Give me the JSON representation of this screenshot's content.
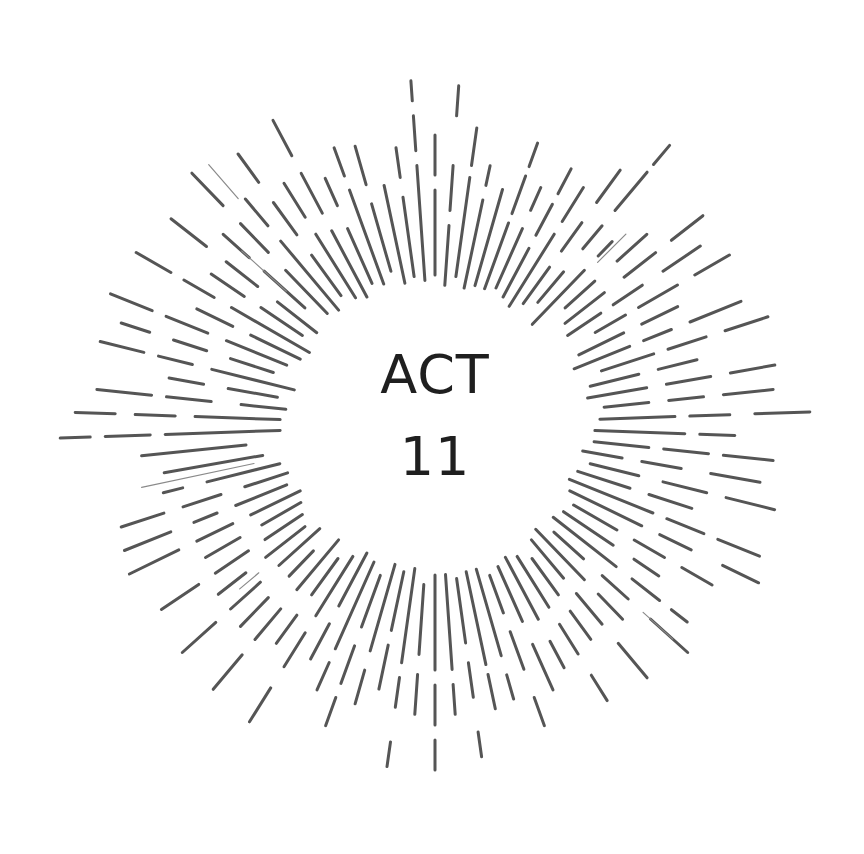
{
  "title": {
    "line1": "ACT",
    "line2": "11"
  },
  "colors": {
    "background": "#ffffff",
    "text": "#1f1f1f",
    "ray": "#555555",
    "ray_light": "#8a8a8a"
  },
  "burst": {
    "center": [
      435,
      425
    ],
    "rays": [
      {
        "a": -90,
        "segs": [
          [
            150,
            235
          ],
          [
            250,
            290
          ]
        ]
      },
      {
        "a": -86,
        "segs": [
          [
            140,
            200
          ],
          [
            215,
            260
          ],
          [
            310,
            340
          ]
        ]
      },
      {
        "a": -82,
        "segs": [
          [
            150,
            250
          ],
          [
            262,
            300
          ]
        ]
      },
      {
        "a": -78,
        "segs": [
          [
            140,
            230
          ],
          [
            245,
            265
          ]
        ]
      },
      {
        "a": -74,
        "segs": [
          [
            145,
            245
          ]
        ]
      },
      {
        "a": -70,
        "segs": [
          [
            145,
            215
          ],
          [
            225,
            265
          ],
          [
            275,
            300
          ]
        ]
      },
      {
        "a": -66,
        "segs": [
          [
            150,
            215
          ],
          [
            235,
            260
          ]
        ]
      },
      {
        "a": -62,
        "segs": [
          [
            145,
            200
          ],
          [
            215,
            250
          ],
          [
            262,
            290
          ]
        ]
      },
      {
        "a": -58,
        "segs": [
          [
            140,
            225
          ],
          [
            240,
            280
          ]
        ]
      },
      {
        "a": -54,
        "segs": [
          [
            150,
            195
          ],
          [
            215,
            250
          ],
          [
            275,
            315
          ]
        ]
      },
      {
        "a": -50,
        "segs": [
          [
            160,
            200
          ],
          [
            230,
            260
          ],
          [
            280,
            330
          ],
          [
            340,
            365
          ]
        ]
      },
      {
        "a": -46,
        "segs": [
          [
            140,
            215
          ],
          [
            235,
            255
          ]
        ]
      },
      {
        "a": -42,
        "segs": [
          [
            175,
            215
          ],
          [
            245,
            285
          ]
        ]
      },
      {
        "a": -38,
        "segs": [
          [
            165,
            215
          ],
          [
            240,
            280
          ],
          [
            300,
            340
          ]
        ]
      },
      {
        "a": -34,
        "segs": [
          [
            160,
            200
          ],
          [
            215,
            250
          ],
          [
            275,
            320
          ]
        ]
      },
      {
        "a": -30,
        "segs": [
          [
            185,
            220
          ],
          [
            235,
            280
          ],
          [
            300,
            340
          ]
        ]
      },
      {
        "a": -26,
        "segs": [
          [
            160,
            210
          ],
          [
            230,
            270
          ]
        ]
      },
      {
        "a": -22,
        "segs": [
          [
            150,
            210
          ],
          [
            225,
            255
          ],
          [
            275,
            330
          ]
        ]
      },
      {
        "a": -18,
        "segs": [
          [
            175,
            230
          ],
          [
            245,
            285
          ],
          [
            305,
            350
          ]
        ]
      },
      {
        "a": -14,
        "segs": [
          [
            160,
            210
          ],
          [
            230,
            270
          ]
        ]
      },
      {
        "a": -10,
        "segs": [
          [
            155,
            215
          ],
          [
            235,
            280
          ],
          [
            300,
            345
          ]
        ]
      },
      {
        "a": -6,
        "segs": [
          [
            170,
            215
          ],
          [
            235,
            270
          ],
          [
            290,
            340
          ]
        ]
      },
      {
        "a": -2,
        "segs": [
          [
            165,
            240
          ],
          [
            255,
            295
          ],
          [
            320,
            375
          ]
        ]
      },
      {
        "a": 2,
        "segs": [
          [
            160,
            250
          ],
          [
            265,
            300
          ]
        ]
      },
      {
        "a": 6,
        "segs": [
          [
            160,
            215
          ],
          [
            230,
            275
          ],
          [
            290,
            340
          ]
        ]
      },
      {
        "a": 10,
        "segs": [
          [
            150,
            190
          ],
          [
            210,
            250
          ],
          [
            280,
            330
          ]
        ]
      },
      {
        "a": 14,
        "segs": [
          [
            160,
            210
          ],
          [
            235,
            280
          ],
          [
            300,
            350
          ]
        ]
      },
      {
        "a": 18,
        "segs": [
          [
            150,
            205
          ],
          [
            225,
            270
          ]
        ]
      },
      {
        "a": 22,
        "segs": [
          [
            145,
            235
          ],
          [
            250,
            290
          ],
          [
            305,
            350
          ]
        ]
      },
      {
        "a": 26,
        "segs": [
          [
            150,
            230
          ],
          [
            250,
            285
          ],
          [
            320,
            360
          ]
        ]
      },
      {
        "a": 30,
        "segs": [
          [
            160,
            210
          ],
          [
            230,
            265
          ],
          [
            285,
            320
          ]
        ]
      },
      {
        "a": 34,
        "segs": [
          [
            155,
            215
          ],
          [
            240,
            270
          ]
        ]
      },
      {
        "a": 38,
        "segs": [
          [
            150,
            230
          ],
          [
            250,
            285
          ],
          [
            300,
            320
          ]
        ]
      },
      {
        "a": 42,
        "segs": [
          [
            160,
            200
          ],
          [
            225,
            260
          ],
          [
            290,
            340
          ]
        ]
      },
      {
        "a": 46,
        "segs": [
          [
            145,
            215
          ],
          [
            235,
            270
          ]
        ]
      },
      {
        "a": 50,
        "segs": [
          [
            150,
            200
          ],
          [
            220,
            260
          ],
          [
            285,
            330
          ]
        ]
      },
      {
        "a": 54,
        "segs": [
          [
            165,
            210
          ],
          [
            230,
            265
          ]
        ]
      },
      {
        "a": 58,
        "segs": [
          [
            155,
            215
          ],
          [
            235,
            270
          ],
          [
            295,
            325
          ]
        ]
      },
      {
        "a": 62,
        "segs": [
          [
            150,
            220
          ],
          [
            245,
            275
          ]
        ]
      },
      {
        "a": 66,
        "segs": [
          [
            155,
            215
          ],
          [
            240,
            290
          ]
        ]
      },
      {
        "a": 70,
        "segs": [
          [
            160,
            200
          ],
          [
            220,
            260
          ],
          [
            290,
            320
          ]
        ]
      },
      {
        "a": 74,
        "segs": [
          [
            150,
            240
          ],
          [
            260,
            285
          ]
        ]
      },
      {
        "a": 78,
        "segs": [
          [
            150,
            245
          ],
          [
            255,
            290
          ]
        ]
      },
      {
        "a": 82,
        "segs": [
          [
            155,
            220
          ],
          [
            240,
            275
          ],
          [
            310,
            335
          ]
        ]
      },
      {
        "a": 86,
        "segs": [
          [
            150,
            245
          ],
          [
            260,
            290
          ]
        ]
      },
      {
        "a": 90,
        "segs": [
          [
            150,
            245
          ],
          [
            260,
            300
          ],
          [
            315,
            345
          ]
        ]
      },
      {
        "a": 94,
        "segs": [
          [
            160,
            230
          ],
          [
            250,
            290
          ]
        ]
      },
      {
        "a": 98,
        "segs": [
          [
            145,
            240
          ],
          [
            255,
            285
          ],
          [
            320,
            345
          ]
        ]
      },
      {
        "a": 102,
        "segs": [
          [
            150,
            210
          ],
          [
            225,
            270
          ]
        ]
      },
      {
        "a": 106,
        "segs": [
          [
            145,
            235
          ],
          [
            255,
            290
          ]
        ]
      },
      {
        "a": 110,
        "segs": [
          [
            160,
            215
          ],
          [
            235,
            275
          ],
          [
            290,
            320
          ]
        ]
      },
      {
        "a": 114,
        "segs": [
          [
            150,
            245
          ],
          [
            260,
            290
          ]
        ]
      },
      {
        "a": 118,
        "segs": [
          [
            145,
            205
          ],
          [
            225,
            265
          ]
        ]
      },
      {
        "a": 122,
        "segs": [
          [
            155,
            225
          ],
          [
            245,
            285
          ],
          [
            310,
            350
          ]
        ]
      },
      {
        "a": 126,
        "segs": [
          [
            165,
            210
          ],
          [
            235,
            270
          ]
        ]
      },
      {
        "a": 130,
        "segs": [
          [
            150,
            215
          ],
          [
            240,
            280
          ],
          [
            300,
            345
          ]
        ]
      },
      {
        "a": 134,
        "segs": [
          [
            175,
            210
          ],
          [
            240,
            280
          ]
        ]
      },
      {
        "a": 138,
        "segs": [
          [
            155,
            210
          ],
          [
            235,
            275
          ],
          [
            295,
            340
          ]
        ]
      },
      {
        "a": 142,
        "segs": [
          [
            165,
            215
          ],
          [
            240,
            275
          ]
        ]
      },
      {
        "a": 146,
        "segs": [
          [
            160,
            205
          ],
          [
            225,
            265
          ],
          [
            285,
            330
          ]
        ]
      },
      {
        "a": 150,
        "segs": [
          [
            155,
            200
          ],
          [
            225,
            265
          ]
        ]
      },
      {
        "a": 154,
        "segs": [
          [
            150,
            205
          ],
          [
            225,
            265
          ],
          [
            285,
            340
          ]
        ]
      },
      {
        "a": 158,
        "segs": [
          [
            160,
            215
          ],
          [
            235,
            260
          ],
          [
            285,
            335
          ]
        ]
      },
      {
        "a": 162,
        "segs": [
          [
            155,
            200
          ],
          [
            225,
            265
          ],
          [
            285,
            330
          ]
        ]
      },
      {
        "a": 166,
        "segs": [
          [
            160,
            235
          ],
          [
            260,
            280
          ]
        ]
      },
      {
        "a": 170,
        "segs": [
          [
            175,
            275
          ]
        ]
      },
      {
        "a": 174,
        "segs": [
          [
            190,
            295
          ]
        ]
      },
      {
        "a": 178,
        "segs": [
          [
            155,
            270
          ],
          [
            285,
            330
          ],
          [
            345,
            375
          ]
        ]
      },
      {
        "a": 182,
        "segs": [
          [
            155,
            240
          ],
          [
            260,
            300
          ],
          [
            320,
            360
          ]
        ]
      },
      {
        "a": 186,
        "segs": [
          [
            150,
            195
          ],
          [
            225,
            270
          ],
          [
            285,
            340
          ]
        ]
      },
      {
        "a": 190,
        "segs": [
          [
            160,
            210
          ],
          [
            235,
            270
          ]
        ]
      },
      {
        "a": 194,
        "segs": [
          [
            145,
            230
          ],
          [
            250,
            285
          ],
          [
            300,
            345
          ]
        ]
      },
      {
        "a": 198,
        "segs": [
          [
            170,
            215
          ],
          [
            240,
            275
          ],
          [
            300,
            330
          ]
        ]
      },
      {
        "a": 202,
        "segs": [
          [
            160,
            225
          ],
          [
            245,
            290
          ],
          [
            305,
            350
          ]
        ]
      },
      {
        "a": 206,
        "segs": [
          [
            150,
            205
          ],
          [
            225,
            265
          ]
        ]
      },
      {
        "a": 210,
        "segs": [
          [
            145,
            235
          ],
          [
            255,
            290
          ],
          [
            305,
            345
          ]
        ]
      },
      {
        "a": 214,
        "segs": [
          [
            160,
            210
          ],
          [
            230,
            270
          ]
        ]
      },
      {
        "a": 218,
        "segs": [
          [
            150,
            200
          ],
          [
            225,
            265
          ],
          [
            290,
            335
          ]
        ]
      },
      {
        "a": 222,
        "segs": [
          [
            175,
            230
          ],
          [
            250,
            285
          ]
        ]
      },
      {
        "a": 226,
        "segs": [
          [
            155,
            215
          ],
          [
            240,
            280
          ],
          [
            305,
            350
          ]
        ]
      },
      {
        "a": 230,
        "segs": [
          [
            150,
            240
          ],
          [
            260,
            295
          ]
        ]
      },
      {
        "a": 234,
        "segs": [
          [
            160,
            210
          ],
          [
            235,
            275
          ],
          [
            300,
            335
          ]
        ]
      },
      {
        "a": 238,
        "segs": [
          [
            150,
            225
          ],
          [
            245,
            285
          ]
        ]
      },
      {
        "a": 242,
        "segs": [
          [
            145,
            220
          ],
          [
            240,
            285
          ],
          [
            305,
            345
          ]
        ]
      },
      {
        "a": 246,
        "segs": [
          [
            155,
            215
          ],
          [
            240,
            270
          ]
        ]
      },
      {
        "a": 250,
        "segs": [
          [
            150,
            250
          ],
          [
            265,
            295
          ]
        ]
      },
      {
        "a": 254,
        "segs": [
          [
            160,
            230
          ],
          [
            250,
            290
          ]
        ]
      },
      {
        "a": 258,
        "segs": [
          [
            145,
            245
          ]
        ]
      },
      {
        "a": 262,
        "segs": [
          [
            150,
            230
          ],
          [
            250,
            280
          ]
        ]
      },
      {
        "a": 266,
        "segs": [
          [
            145,
            260
          ],
          [
            275,
            310
          ],
          [
            325,
            345
          ]
        ]
      }
    ],
    "light_rays": [
      {
        "a": -131,
        "segs": [
          [
            300,
            345
          ]
        ]
      },
      {
        "a": -45,
        "segs": [
          [
            230,
            270
          ]
        ]
      },
      {
        "a": 42,
        "segs": [
          [
            280,
            320
          ]
        ]
      },
      {
        "a": 140,
        "segs": [
          [
            230,
            255
          ]
        ]
      },
      {
        "a": 168,
        "segs": [
          [
            185,
            300
          ]
        ]
      },
      {
        "a": -138,
        "segs": [
          [
            200,
            260
          ]
        ]
      }
    ]
  }
}
